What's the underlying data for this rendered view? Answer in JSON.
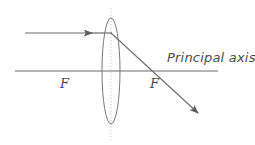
{
  "diagram": {
    "type": "optics-ray-diagram",
    "background_color": "#ffffff",
    "stroke_color": "#6b6b6b",
    "label_color": "#4a4a4a",
    "dotted_color": "#b9b9b9",
    "labels": {
      "principal_axis": "Principal axis",
      "focal_point_left": "F",
      "focal_point_right": "F"
    },
    "elements": {
      "principal_axis": {
        "name": "principal-axis-line",
        "x1": 15,
        "y1": 71,
        "x2": 218,
        "y2": 71
      },
      "optical_axis_vertical": {
        "name": "lens-vertical-axis",
        "x1": 111,
        "y1": 8,
        "x2": 111,
        "y2": 140,
        "style": "dotted"
      },
      "lens": {
        "name": "converging-lens",
        "center_x": 111,
        "center_y": 71,
        "rx": 9,
        "ry": 53
      },
      "incident_ray": {
        "name": "incident-ray",
        "x1": 25,
        "y1": 33,
        "x2": 111,
        "y2": 33,
        "arrow_at_x": 91,
        "arrow_at_y": 33
      },
      "refracted_ray": {
        "name": "refracted-ray",
        "x1": 111,
        "y1": 33,
        "x2": 198,
        "y2": 113
      },
      "focal_point_left_marker": {
        "x": 66,
        "y": 71
      },
      "focal_point_right_marker": {
        "x": 160,
        "y": 71
      }
    }
  }
}
